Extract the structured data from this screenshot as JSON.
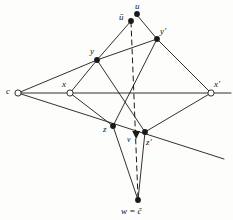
{
  "figure": {
    "caption": "",
    "background_color": "#fdfdfb",
    "stroke_color": "#1a1a1a",
    "labels": {
      "c": "c",
      "x": "x",
      "x_prime": "x′",
      "y": "y",
      "y_prime": "y′",
      "z": "z",
      "z_prime": "z′",
      "u": "u",
      "u_bar": "ū",
      "v": "v",
      "w_eq_c_hat": "w = č"
    },
    "points": [
      {
        "id": "c",
        "label": "c",
        "x": 18,
        "y": 93,
        "marker": "open-circle"
      },
      {
        "id": "x",
        "label": "x",
        "x": 70,
        "y": 93,
        "marker": "open-circle"
      },
      {
        "id": "x_prime",
        "label": "x′",
        "x": 211,
        "y": 93,
        "marker": "open-circle"
      },
      {
        "id": "y",
        "label": "y",
        "x": 97,
        "y": 60,
        "marker": "filled-dot"
      },
      {
        "id": "y_prime",
        "label": "y′",
        "x": 157,
        "y": 39,
        "marker": "filled-dot"
      },
      {
        "id": "z",
        "label": "z",
        "x": 113,
        "y": 126,
        "marker": "filled-dot"
      },
      {
        "id": "z_prime",
        "label": "z′",
        "x": 145,
        "y": 132,
        "marker": "filled-dot"
      },
      {
        "id": "u",
        "label": "u",
        "x": 136,
        "y": 14,
        "marker": "filled-dot"
      },
      {
        "id": "u_bar",
        "label": "ū",
        "x": 131,
        "y": 21,
        "marker": "filled-dot"
      },
      {
        "id": "v",
        "label": "v",
        "x": 136,
        "y": 136,
        "marker": "filled-triangle-down"
      },
      {
        "id": "w",
        "label": "w = č",
        "x": 138,
        "y": 200,
        "marker": "filled-dot"
      }
    ],
    "edges": [
      {
        "from": "c",
        "to": "y",
        "style": "solid"
      },
      {
        "from": "c",
        "to": "x_prime",
        "style": "solid"
      },
      {
        "from": "c",
        "to": "z_prime_ext",
        "style": "solid"
      },
      {
        "from": "y",
        "to": "u_bar",
        "style": "solid"
      },
      {
        "from": "u",
        "to": "y_prime",
        "style": "solid"
      },
      {
        "from": "y",
        "to": "y_prime",
        "style": "solid"
      },
      {
        "from": "y_prime",
        "to": "x_prime",
        "style": "solid"
      },
      {
        "from": "y",
        "to": "x",
        "style": "solid"
      },
      {
        "from": "x",
        "to": "z",
        "style": "solid"
      },
      {
        "from": "z",
        "to": "z_prime_ext",
        "style": "solid"
      },
      {
        "from": "z_prime",
        "to": "x_prime",
        "style": "solid"
      },
      {
        "from": "y",
        "to": "z_prime",
        "style": "solid"
      },
      {
        "from": "y_prime",
        "to": "z",
        "style": "solid"
      },
      {
        "from": "z",
        "to": "w",
        "style": "solid"
      },
      {
        "from": "z_prime",
        "to": "w",
        "style": "solid"
      },
      {
        "from": "u_bar",
        "to": "w",
        "style": "dashed"
      }
    ]
  }
}
